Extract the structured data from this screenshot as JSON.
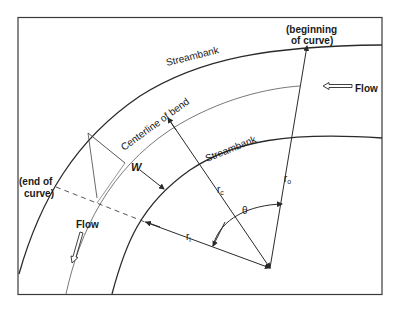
{
  "diagram": {
    "labels": {
      "outer_streambank": "Streambank",
      "inner_streambank": "Streambank",
      "centerline": "Centerline of bend",
      "beginning_line1": "(beginning",
      "beginning_line2": "of curve)",
      "end_line1": "(end of",
      "end_line2": "curve)",
      "flow_right": "Flow",
      "flow_left": "Flow",
      "width": "W",
      "r_c": "r",
      "r_c_sub": "c",
      "r_o": "r",
      "r_o_sub": "o",
      "r_i": "r",
      "r_i_sub": "i",
      "theta": "θ"
    },
    "colors": {
      "line": "#2a2a2a",
      "frame": "#3a3a3a",
      "background": "#ffffff"
    }
  }
}
